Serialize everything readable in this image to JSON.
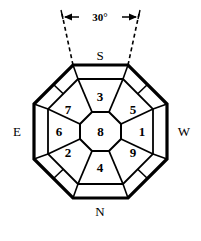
{
  "figure": {
    "background_color": "#ffffff",
    "line_color": "#000000"
  },
  "annotation": {
    "angle_label": "30°",
    "dimension_style": "double-arrow",
    "guide_line_style": "dashed"
  },
  "compass": {
    "top": "S",
    "bottom": "N",
    "left": "E",
    "right": "W"
  },
  "sectors": [
    {
      "id": "sector-top",
      "label": "3",
      "position": "top"
    },
    {
      "id": "sector-top-right",
      "label": "5",
      "position": "top-right"
    },
    {
      "id": "sector-right",
      "label": "1",
      "position": "right"
    },
    {
      "id": "sector-bottom-right",
      "label": "9",
      "position": "bottom-right"
    },
    {
      "id": "sector-bottom",
      "label": "4",
      "position": "bottom"
    },
    {
      "id": "sector-bottom-left",
      "label": "2",
      "position": "bottom-left"
    },
    {
      "id": "sector-left",
      "label": "6",
      "position": "left"
    },
    {
      "id": "sector-top-left",
      "label": "7",
      "position": "top-left"
    }
  ],
  "center": {
    "label": "8",
    "shape": "octagon"
  }
}
